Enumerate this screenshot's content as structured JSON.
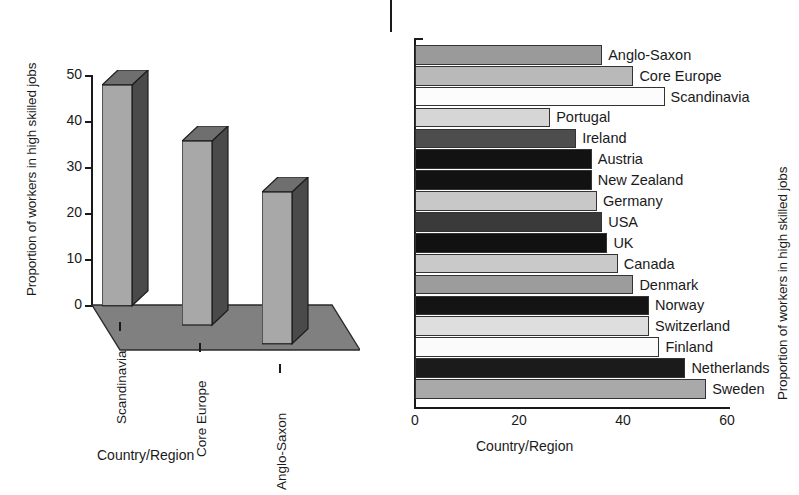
{
  "figure": {
    "background": "#ffffff",
    "text_color": "#1a1a1a"
  },
  "left": {
    "ylabel": "Proportion of workers in high skilled jobs",
    "xlabel": "Country/Region",
    "yticks": [
      "0",
      "10",
      "20",
      "30",
      "40",
      "50"
    ],
    "categories": [
      "Scandinavia",
      "Core Europe",
      "Anglo-Saxon"
    ],
    "values": [
      48,
      40,
      33
    ],
    "colors": {
      "front": "#a8a8a8",
      "side": "#4a4a4a",
      "top": "#6f6f6f",
      "floor": "#808080"
    }
  },
  "right": {
    "ylabel": "Proportion of workers in high skilled jobs",
    "xlabel": "Country/Region",
    "xticks": [
      "0",
      "20",
      "40",
      "60"
    ],
    "xtick_values": [
      0,
      20,
      40,
      60
    ],
    "bars": [
      {
        "label": "Anglo-Saxon",
        "value": 36,
        "color": "#9a9a9a"
      },
      {
        "label": "Core Europe",
        "value": 42,
        "color": "#b9b9b9"
      },
      {
        "label": "Scandinavia",
        "value": 48,
        "color": "#fcfcfc"
      },
      {
        "label": "Portugal",
        "value": 26,
        "color": "#d6d6d6"
      },
      {
        "label": "Ireland",
        "value": 31,
        "color": "#4d4d4d"
      },
      {
        "label": "Austria",
        "value": 34,
        "color": "#121212"
      },
      {
        "label": "New Zealand",
        "value": 34,
        "color": "#121212"
      },
      {
        "label": "Germany",
        "value": 35,
        "color": "#c8c8c8"
      },
      {
        "label": "USA",
        "value": 36,
        "color": "#3a3a3a"
      },
      {
        "label": "UK",
        "value": 37,
        "color": "#111111"
      },
      {
        "label": "Canada",
        "value": 39,
        "color": "#c9c9c9"
      },
      {
        "label": "Denmark",
        "value": 42,
        "color": "#9c9c9c"
      },
      {
        "label": "Norway",
        "value": 45,
        "color": "#141414"
      },
      {
        "label": "Switzerland",
        "value": 45,
        "color": "#dedede"
      },
      {
        "label": "Finland",
        "value": 47,
        "color": "#fbfbfb"
      },
      {
        "label": "Netherlands",
        "value": 52,
        "color": "#1b1b1b"
      },
      {
        "label": "Sweden",
        "value": 56,
        "color": "#a9a9a9"
      }
    ]
  },
  "chart_data": [
    {
      "type": "bar",
      "title": "",
      "subtitle": "",
      "orientation": "vertical-3d",
      "categories": [
        "Scandinavia",
        "Core Europe",
        "Anglo-Saxon"
      ],
      "values": [
        48,
        40,
        33
      ],
      "xlabel": "Country/Region",
      "ylabel": "Proportion of workers in high skilled jobs",
      "ylim": [
        0,
        50
      ],
      "yticks": [
        0,
        10,
        20,
        30,
        40,
        50
      ],
      "grid": false,
      "legend": "none"
    },
    {
      "type": "bar",
      "title": "",
      "subtitle": "",
      "orientation": "horizontal",
      "categories": [
        "Anglo-Saxon",
        "Core Europe",
        "Scandinavia",
        "Portugal",
        "Ireland",
        "Austria",
        "New Zealand",
        "Germany",
        "USA",
        "UK",
        "Canada",
        "Denmark",
        "Norway",
        "Switzerland",
        "Finland",
        "Netherlands",
        "Sweden"
      ],
      "values": [
        36,
        42,
        48,
        26,
        31,
        34,
        34,
        35,
        36,
        37,
        39,
        42,
        45,
        45,
        47,
        52,
        56
      ],
      "xlabel": "Country/Region",
      "ylabel": "Proportion of workers in high skilled jobs",
      "xlim": [
        0,
        60
      ],
      "xticks": [
        0,
        20,
        40,
        60
      ],
      "grid": false,
      "legend": "none",
      "annotations": "Each bar is labelled in-place to the right of its end."
    }
  ]
}
